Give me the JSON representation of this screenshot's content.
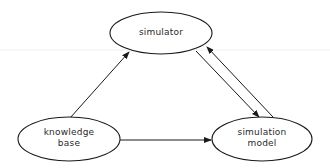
{
  "diagram": {
    "type": "flow-diagram",
    "stroke_color": "#1a1a1a",
    "background": "#ffffff",
    "nodes": [
      {
        "id": "simulator",
        "shape": "ellipse",
        "lines": [
          "simulator"
        ],
        "cx": 161,
        "cy": 33,
        "rx": 51,
        "ry": 21
      },
      {
        "id": "knowledge-base",
        "shape": "ellipse",
        "lines": [
          "knowledge",
          "base"
        ],
        "cx": 69,
        "cy": 139,
        "rx": 51,
        "ry": 22
      },
      {
        "id": "simulation-model",
        "shape": "ellipse",
        "lines": [
          "simulation",
          "model"
        ],
        "cx": 262,
        "cy": 139,
        "rx": 50,
        "ry": 22
      }
    ],
    "edges": [
      {
        "from": "knowledge-base",
        "to": "simulator",
        "x1": 70,
        "y1": 118,
        "x2": 129,
        "y2": 52
      },
      {
        "from": "knowledge-base",
        "to": "simulation-model",
        "x1": 120,
        "y1": 140,
        "x2": 211,
        "y2": 140
      },
      {
        "from": "simulator",
        "to": "simulation-model",
        "x1": 196,
        "y1": 51,
        "x2": 259,
        "y2": 117
      },
      {
        "from": "simulation-model",
        "to": "simulator",
        "x1": 273,
        "y1": 117,
        "x2": 207,
        "y2": 47
      }
    ]
  }
}
